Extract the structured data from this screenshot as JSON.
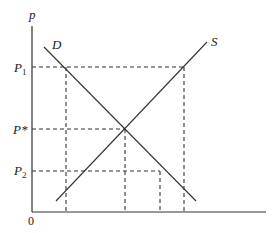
{
  "diagram": {
    "type": "supply-demand",
    "axes": {
      "y_label": "p",
      "origin_label": "0"
    },
    "curves": {
      "demand": {
        "label": "D"
      },
      "supply": {
        "label": "S"
      }
    },
    "price_levels": [
      {
        "id": "p1",
        "label": "P",
        "subscript": "1"
      },
      {
        "id": "pstar",
        "label": "P*",
        "subscript": ""
      },
      {
        "id": "p2",
        "label": "P",
        "subscript": "2"
      }
    ]
  }
}
